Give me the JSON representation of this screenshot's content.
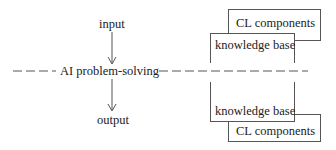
{
  "diagram": {
    "center_label": "AI problem-solving",
    "input_label": "input",
    "output_label": "output",
    "upper_stack": {
      "front_box": "knowledge base",
      "back_box": "CL components"
    },
    "lower_stack": {
      "front_box": "knowledge base",
      "back_box": "CL components"
    },
    "colors": {
      "line": "#555555",
      "text": "#222222",
      "background": "#ffffff"
    }
  }
}
